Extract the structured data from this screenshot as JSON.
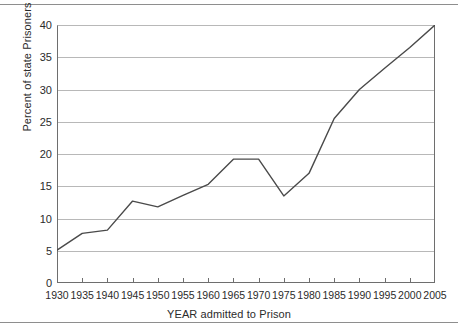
{
  "chart_data": {
    "type": "line",
    "title": "",
    "xlabel": "YEAR admitted to Prison",
    "ylabel": "Percent of state Prisoners",
    "x": [
      1930,
      1935,
      1940,
      1945,
      1950,
      1955,
      1960,
      1965,
      1970,
      1975,
      1980,
      1985,
      1990,
      1995,
      2000,
      2005
    ],
    "values": [
      5.1,
      7.7,
      8.2,
      12.7,
      11.8,
      13.6,
      15.3,
      19.2,
      19.2,
      13.5,
      17.0,
      25.5,
      30.0,
      33.3,
      36.5,
      40.0
    ],
    "xtick_labels": [
      "1930",
      "1935",
      "1940",
      "1945",
      "1950",
      "1955",
      "1960",
      "1965",
      "1970",
      "1975",
      "1980",
      "1985",
      "1990",
      "1995",
      "2000",
      "2005"
    ],
    "ytick_labels": [
      "0",
      "5",
      "10",
      "15",
      "20",
      "25",
      "30",
      "35",
      "40"
    ],
    "yticks": [
      0,
      5,
      10,
      15,
      20,
      25,
      30,
      35,
      40
    ],
    "xlim": [
      1930,
      2005
    ],
    "ylim": [
      0,
      40
    ],
    "grid": "horizontal",
    "legend": "none",
    "line_color": "#4a4a4a",
    "grid_color": "#b8b8b8",
    "axis_color": "#6e6e6e",
    "background_color": "#ffffff"
  }
}
